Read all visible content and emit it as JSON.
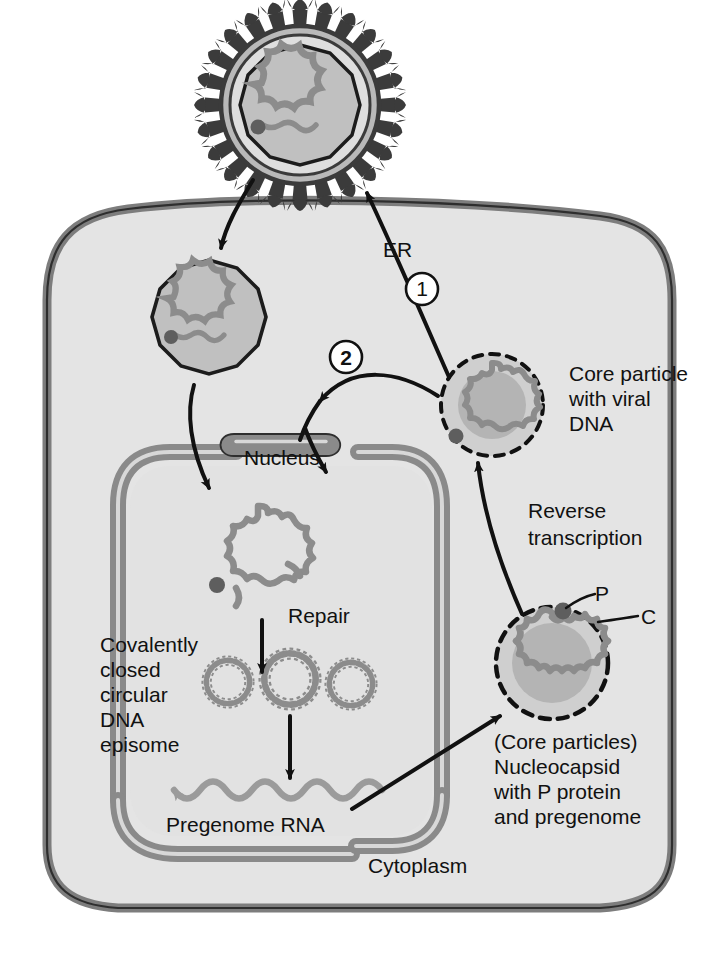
{
  "figure": {
    "type": "cell-biology-diagram"
  },
  "colors": {
    "cell_fill": "#e2e2e2",
    "cytoplasm_fill": "#e4e4e4",
    "membrane_stroke": "#7d7d7d",
    "nucleus_fill": "#e0e0e0",
    "envelope_band": "#8a8a8a",
    "capsid_fill": "#c0c0c0",
    "capsid_inner": "#b4b4b4",
    "dna_strand": "#8c8c8c",
    "rna_strand": "#9b9b9b",
    "p_protein_dot": "#636363",
    "spike_dark": "#3b3b3b",
    "outline_black": "#111111",
    "page_background": "#ffffff"
  },
  "labels": {
    "er": "ER",
    "step_one": "1",
    "step_two": "2",
    "core_particle": [
      "Core particle",
      "with viral",
      "DNA"
    ],
    "nucleus": "Nucleus",
    "reverse_transcription": [
      "Reverse",
      "transcription"
    ],
    "repair": "Repair",
    "cccdna": [
      "Covalently",
      "closed",
      "circular",
      "DNA",
      "episome"
    ],
    "pregenome_rna": "Pregenome RNA",
    "p_protein": "P",
    "c_protein": "C",
    "nucleocapsid": [
      "(Core particles)",
      "Nucleocapsid",
      "with P protein",
      "and pregenome"
    ],
    "cytoplasm": "Cytoplasm"
  },
  "structures": {
    "virion": "enveloped virion with surface spikes and relaxed circular DNA",
    "entering_core": "naked core particle inside cytoplasm with viral DNA",
    "nuclear_dna": "relaxed circular partially double-stranded DNA with P protein",
    "episomes": "three covalently closed circular DNA episomes",
    "rna_wave": "pregenome RNA wavy strand with leftward arrowhead",
    "core_dashed_top": "core particle with viral DNA, dashed capsid",
    "core_dashed_bottom": "nucleocapsid with P protein and pregenome, dashed capsid"
  }
}
